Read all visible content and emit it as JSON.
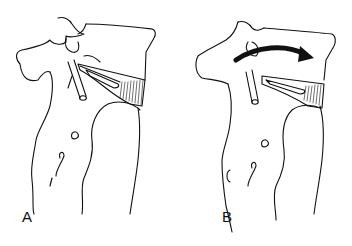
{
  "figure": {
    "panels": [
      {
        "id": "A",
        "label": "A",
        "shows_arrow": false
      },
      {
        "id": "B",
        "label": "B",
        "shows_arrow": true
      }
    ],
    "colors": {
      "line": "#111111",
      "background": "#ffffff",
      "arrow": "#111111"
    }
  }
}
